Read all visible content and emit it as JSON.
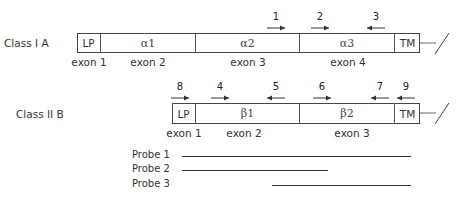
{
  "class_i": {
    "label": "Class I A",
    "segments": [
      {
        "name": "LP",
        "x0": 77,
        "x1": 101
      },
      {
        "name": "α1",
        "x0": 101,
        "x1": 196
      },
      {
        "name": "α2",
        "x0": 196,
        "x1": 300
      },
      {
        "name": "α3",
        "x0": 300,
        "x1": 395
      },
      {
        "name": "TM",
        "x0": 395,
        "x1": 420
      }
    ],
    "exons": [
      {
        "label": "exon 1",
        "x": 89
      },
      {
        "label": "exon 2",
        "x": 148
      },
      {
        "label": "exon 3",
        "x": 248
      },
      {
        "label": "exon 4",
        "x": 348
      }
    ],
    "primers": [
      {
        "num": "1",
        "x": 276,
        "dir": "right"
      },
      {
        "num": "2",
        "x": 320,
        "dir": "right"
      },
      {
        "num": "3",
        "x": 376,
        "dir": "left"
      }
    ]
  },
  "class_ii": {
    "label": "Class II B",
    "segments": [
      {
        "name": "LP",
        "x0": 172,
        "x1": 196
      },
      {
        "name": "β1",
        "x0": 196,
        "x1": 300
      },
      {
        "name": "β2",
        "x0": 300,
        "x1": 395
      },
      {
        "name": "TM",
        "x0": 395,
        "x1": 420
      }
    ],
    "exons": [
      {
        "label": "exon 1",
        "x": 184
      },
      {
        "label": "exon 2",
        "x": 244
      },
      {
        "label": "exon 3",
        "x": 352
      }
    ],
    "primers": [
      {
        "num": "8",
        "x": 180,
        "dir": "right"
      },
      {
        "num": "4",
        "x": 220,
        "dir": "right"
      },
      {
        "num": "5",
        "x": 276,
        "dir": "left"
      },
      {
        "num": "6",
        "x": 322,
        "dir": "right"
      },
      {
        "num": "7",
        "x": 380,
        "dir": "left"
      },
      {
        "num": "9",
        "x": 406,
        "dir": "left"
      }
    ]
  },
  "probes": [
    {
      "label": "Probe 1",
      "x0": 182,
      "x1": 411
    },
    {
      "label": "Probe 2",
      "x0": 182,
      "x1": 328
    },
    {
      "label": "Probe 3",
      "x0": 272,
      "x1": 411
    }
  ]
}
